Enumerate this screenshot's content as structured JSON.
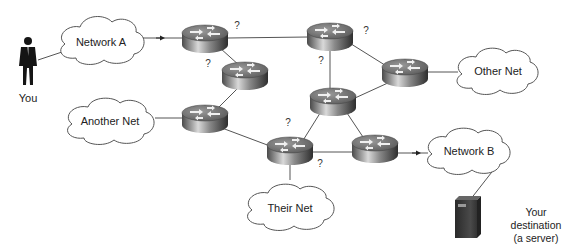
{
  "diagram": {
    "user": {
      "label": "You"
    },
    "clouds": [
      {
        "id": "network-a",
        "label": "Network A"
      },
      {
        "id": "another-net",
        "label": "Another Net"
      },
      {
        "id": "other-net",
        "label": "Other Net"
      },
      {
        "id": "network-b",
        "label": "Network B"
      },
      {
        "id": "their-net",
        "label": "Their Net"
      }
    ],
    "routers": [
      {
        "id": "r1"
      },
      {
        "id": "r2"
      },
      {
        "id": "r3"
      },
      {
        "id": "r4"
      },
      {
        "id": "r5"
      },
      {
        "id": "r6"
      },
      {
        "id": "r7"
      },
      {
        "id": "r8"
      }
    ],
    "question_marks": [
      "?",
      "?",
      "?",
      "?",
      "?",
      "?",
      "?"
    ],
    "server": {
      "line1": "Your",
      "line2": "destination",
      "line3": "(a server)"
    },
    "colors": {
      "line": "#555555",
      "cloud_stroke": "#555555",
      "router_dark": "#3a3a3a",
      "router_light": "#d8d8d8",
      "server": "#3c3c3c"
    }
  }
}
